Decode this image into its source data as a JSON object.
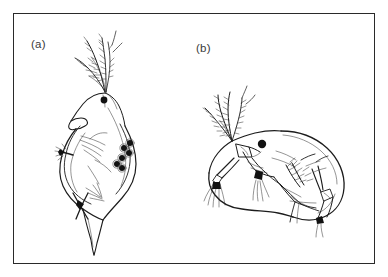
{
  "figure": {
    "background_color": "#ffffff",
    "frame": {
      "stroke_color": "#2a2a2a",
      "x": 13,
      "y": 13,
      "width": 362,
      "height": 251
    },
    "ink_color": "#1c1c1c",
    "panels": [
      {
        "id": "a",
        "label": "(a)",
        "subject": "water-flea-lateral-upright",
        "description": "Cladoceran (water flea) drawn in near-vertical orientation with branched swimming antennae at top, dark compound eye, rostrum, carapace with brood chamber containing eggs, and pointed tail spine at bottom.",
        "eggs_visible": 6,
        "eye_color": "#121212"
      },
      {
        "id": "b",
        "label": "(b)",
        "subject": "water-flea-lateral-left-facing",
        "description": "Cladoceran (water flea) drawn in lateral view facing left, with plumose branched antennae, dark compound eye, antennule, rounded carapace, thoracic limbs and setae, and post-abdominal claw.",
        "eggs_visible": 0,
        "eye_color": "#121212"
      }
    ]
  }
}
